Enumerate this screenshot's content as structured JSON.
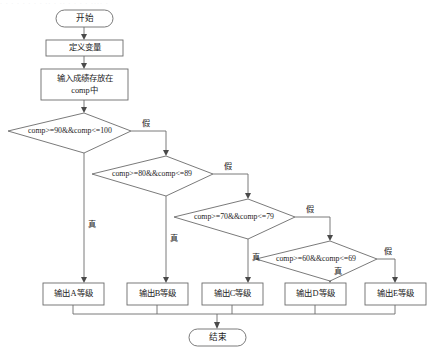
{
  "diagram": {
    "type": "flowchart",
    "background_color": "#ffffff",
    "line_color": "#6b6b6b",
    "text_color": "#1c1c1c"
  },
  "nodes": {
    "start": {
      "label": "开始",
      "shape": "terminator"
    },
    "declare": {
      "label": "定义变量",
      "shape": "process"
    },
    "input_line1": "输入成绩存放在",
    "input_line2": "comp中",
    "end": {
      "label": "结束",
      "shape": "terminator"
    }
  },
  "conditions": [
    {
      "id": "cond-a",
      "label": "comp>=90&&comp<=100"
    },
    {
      "id": "cond-b",
      "label": "comp>=80&&comp<=89"
    },
    {
      "id": "cond-c",
      "label": "comp>=70&&comp<=79"
    },
    {
      "id": "cond-d",
      "label": "comp>=60&&comp<=69"
    }
  ],
  "outputs": [
    {
      "id": "out-a",
      "label": "输出A等级"
    },
    {
      "id": "out-b",
      "label": "输出B等级"
    },
    {
      "id": "out-c",
      "label": "输出C等级"
    },
    {
      "id": "out-d",
      "label": "输出D等级"
    },
    {
      "id": "out-e",
      "label": "输出E等级"
    }
  ],
  "edge_labels": {
    "true": "真",
    "false": "假",
    "true_a": "真",
    "true_b": "真",
    "true_c": "真",
    "true_d": "真",
    "false_a": "假",
    "false_b": "假",
    "false_c": "假",
    "false_d": "假"
  },
  "header_strip": "· · ·  · · · ·  · ·· ·  ·· ·  · · ·   ···· ·"
}
